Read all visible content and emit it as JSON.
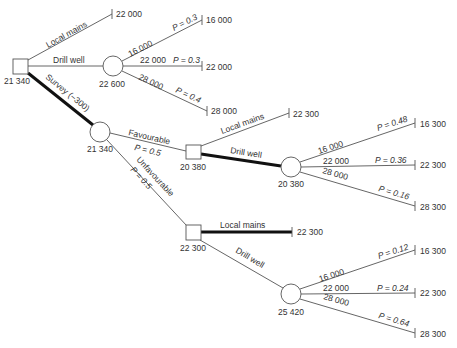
{
  "diagram": {
    "type": "decision-tree",
    "nodes": {
      "root": {
        "kind": "decision",
        "value": "21 340"
      },
      "drill1": {
        "kind": "chance",
        "value": "22 600"
      },
      "survey": {
        "kind": "chance",
        "value": "21 340"
      },
      "fav_decision": {
        "kind": "decision",
        "value": "20 380"
      },
      "fav_drill": {
        "kind": "chance",
        "value": "20 380"
      },
      "unfav_decision": {
        "kind": "decision",
        "value": "22 300"
      },
      "unfav_drill": {
        "kind": "chance",
        "value": "25 420"
      }
    },
    "branches": {
      "root_local": {
        "label": "Local mains",
        "outcome": "22 000",
        "chosen": false
      },
      "root_drill": {
        "label": "Drill well",
        "chosen": false
      },
      "root_survey": {
        "label": "Survey (−300)",
        "chosen": true
      },
      "drill1_a": {
        "cost": "16 000",
        "prob": "P = 0.3",
        "outcome": "16 000"
      },
      "drill1_b": {
        "cost": "22 000",
        "prob": "P = 0.3",
        "outcome": "22 000"
      },
      "drill1_c": {
        "cost": "28 000",
        "prob": "P = 0.4",
        "outcome": "28 000"
      },
      "survey_fav": {
        "label": "Favourable",
        "prob": "P = 0.5"
      },
      "survey_unfav": {
        "label": "Unfavourable",
        "prob": "P = 0.5"
      },
      "fav_local": {
        "label": "Local mains",
        "outcome": "22 300",
        "chosen": false
      },
      "fav_drill": {
        "label": "Drill well",
        "chosen": true
      },
      "fav_drill_a": {
        "cost": "16 000",
        "prob": "P = 0.48",
        "outcome": "16 300"
      },
      "fav_drill_b": {
        "cost": "22 000",
        "prob": "P = 0.36",
        "outcome": "22 300"
      },
      "fav_drill_c": {
        "cost": "28 000",
        "prob": "P = 0.16",
        "outcome": "28 300"
      },
      "unfav_local": {
        "label": "Local mains",
        "outcome": "22 300",
        "chosen": true
      },
      "unfav_drill": {
        "label": "Drill well",
        "chosen": false
      },
      "unfav_drill_a": {
        "cost": "16 000",
        "prob": "P = 0.12",
        "outcome": "16 300"
      },
      "unfav_drill_b": {
        "cost": "22 000",
        "prob": "P = 0.24",
        "outcome": "22 300"
      },
      "unfav_drill_c": {
        "cost": "28 000",
        "prob": "P = 0.64",
        "outcome": "28 300"
      }
    }
  }
}
